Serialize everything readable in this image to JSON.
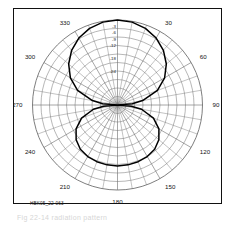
{
  "figure": {
    "id_label": "HBK05_22-063",
    "caption_partial": "Fig  22-14     radiation  pattern",
    "frame_color": "#111111",
    "grid_color": "#6f6f6f",
    "curve_color": "#000000",
    "background": "#ffffff"
  },
  "chart_data": {
    "type": "line",
    "subtype": "polar-radiation-pattern",
    "title": "",
    "subtitle": "",
    "xlabel": "",
    "ylabel": "",
    "grid": true,
    "legend_position": "none",
    "angle_unit": "degrees",
    "angle_direction": "clockwise",
    "angle_zero_at": "top",
    "angle_ticks": [
      0,
      30,
      60,
      90,
      120,
      150,
      180,
      210,
      240,
      270,
      300,
      330
    ],
    "angle_tick_labels": [
      "0",
      "30",
      "60",
      "90",
      "120",
      "150",
      "180",
      "210",
      "240",
      "270",
      "300",
      "330"
    ],
    "angle_minor_step": 10,
    "radial_unit": "dB",
    "radial_tick_labels": [
      "-3",
      "-6",
      "-9",
      "-12",
      "-18",
      "-24"
    ],
    "radial_tick_db": [
      -3,
      -6,
      -9,
      -12,
      -18,
      -24
    ],
    "radial_outer_db": 0,
    "radial_center_db": -40,
    "ring_count": 10,
    "annotations": [
      "HBK05_22-063"
    ],
    "series": [
      {
        "name": "antenna pattern",
        "angles": [
          0,
          10,
          20,
          30,
          40,
          50,
          60,
          70,
          80,
          85,
          90,
          95,
          100,
          110,
          120,
          130,
          140,
          150,
          160,
          170,
          180,
          190,
          200,
          210,
          220,
          230,
          240,
          250,
          260,
          265,
          270,
          275,
          280,
          290,
          300,
          310,
          320,
          330,
          340,
          350,
          360
        ],
        "values_db": [
          0,
          -0.4,
          -1.6,
          -3.6,
          -6.4,
          -10.0,
          -14.4,
          -20.0,
          -28.0,
          -33.0,
          -40,
          -33.5,
          -28.5,
          -22.0,
          -17.5,
          -14.6,
          -12.8,
          -12.0,
          -11.6,
          -11.4,
          -11.3,
          -11.4,
          -11.6,
          -12.0,
          -12.8,
          -14.6,
          -17.5,
          -22.0,
          -28.5,
          -33.5,
          -40,
          -33.0,
          -28.0,
          -20.0,
          -14.4,
          -10.0,
          -6.4,
          -3.6,
          -1.6,
          -0.4,
          0
        ]
      }
    ]
  }
}
